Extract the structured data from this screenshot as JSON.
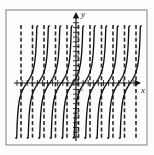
{
  "figure": {
    "kind": "math-plot",
    "background_color": "#fdfdfc",
    "frame": {
      "name": "plot-frame",
      "x": 6,
      "y": 10,
      "width": 141,
      "height": 135,
      "stroke_color": "#8a8a86",
      "stroke_width": 1.1
    },
    "axes": {
      "x_label": "x",
      "y_label": "y",
      "origin_label": "O",
      "axis_color": "#151515",
      "x_axis_y": 83,
      "y_axis_x": 76,
      "x_axis_start": 14,
      "x_axis_end": 141,
      "y_axis_top": 12,
      "y_axis_bottom": 141,
      "x_label_pos": {
        "x": 141,
        "y": 93
      },
      "y_label_pos": {
        "x": 81,
        "y": 17
      },
      "origin_label_pos": {
        "x": 79,
        "y": 91
      },
      "x_tick_count": 24,
      "y_tick_count": 26,
      "tick_half_len": 3
    },
    "asymptotes": {
      "name": "vertical-asymptotes",
      "color": "#2a2a2a",
      "stroke_width": 1.6,
      "dash": "4,2.4",
      "top": 25,
      "bottom": 139,
      "x_positions": [
        21,
        32.5,
        44,
        55.5,
        67,
        78.5,
        90,
        101.5,
        113,
        124.5,
        136
      ]
    },
    "curves": {
      "name": "tangent-branches",
      "color": "#111111",
      "stroke_width": 1.35,
      "top": 26,
      "bottom": 138,
      "branch_centers": [
        26.75,
        38.25,
        49.75,
        61.25,
        72.75,
        84.25,
        95.75,
        107.25,
        118.75,
        130.25
      ],
      "half_period": 11.5
    }
  },
  "chart_data": {
    "type": "line",
    "title": "",
    "subtitle": "",
    "xlabel": "x",
    "ylabel": "y",
    "legend": [],
    "grid": false,
    "function_description": "periodic tangent-type curve with vertical asymptotes",
    "period": 23,
    "asymptote_x_values": [
      -5.5,
      -4.5,
      -3.5,
      -2.5,
      -1.5,
      -0.5,
      0.5,
      1.5,
      2.5,
      3.5,
      4.5
    ],
    "zero_crossings_x": [
      -5,
      -4,
      -3,
      -2,
      -1,
      0,
      1,
      2,
      3,
      4
    ],
    "xlim": [
      -6.0,
      5.6
    ],
    "ylim": [
      -3.1,
      3.2
    ],
    "series": [
      {
        "name": "y = tan(pi*x)",
        "points_note": "each branch rises from -infinity at left asymptote to +infinity at right asymptote, crossing y=0 midway"
      }
    ]
  }
}
